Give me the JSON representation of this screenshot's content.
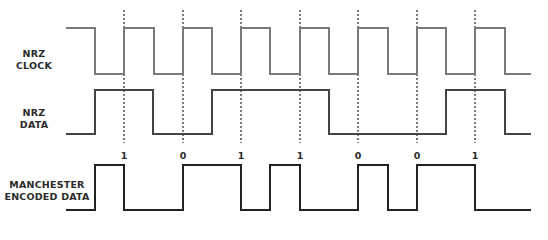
{
  "diagram": {
    "signals": [
      {
        "id": "nrz-clock",
        "label_lines": [
          "NRZ",
          "CLOCK"
        ],
        "color": "#7a7a7a",
        "y_high": 28,
        "y_low": 74,
        "points": [
          [
            66,
            28
          ],
          [
            95,
            28
          ],
          [
            95,
            74
          ],
          [
            124,
            74
          ],
          [
            124,
            28
          ],
          [
            154,
            28
          ],
          [
            154,
            74
          ],
          [
            183,
            74
          ],
          [
            183,
            28
          ],
          [
            212,
            28
          ],
          [
            212,
            74
          ],
          [
            241,
            74
          ],
          [
            241,
            28
          ],
          [
            270,
            28
          ],
          [
            270,
            74
          ],
          [
            300,
            74
          ],
          [
            300,
            28
          ],
          [
            329,
            28
          ],
          [
            329,
            74
          ],
          [
            358,
            74
          ],
          [
            358,
            28
          ],
          [
            388,
            28
          ],
          [
            388,
            74
          ],
          [
            417,
            74
          ],
          [
            417,
            28
          ],
          [
            446,
            28
          ],
          [
            446,
            74
          ],
          [
            475,
            74
          ],
          [
            475,
            28
          ],
          [
            505,
            28
          ],
          [
            505,
            74
          ],
          [
            531,
            74
          ]
        ]
      },
      {
        "id": "nrz-data",
        "label_lines": [
          "NRZ",
          "DATA"
        ],
        "color": "#444444",
        "y_high": 90,
        "y_low": 134,
        "points": [
          [
            66,
            134
          ],
          [
            95,
            134
          ],
          [
            95,
            90
          ],
          [
            153,
            90
          ],
          [
            153,
            134
          ],
          [
            212,
            134
          ],
          [
            212,
            90
          ],
          [
            329,
            90
          ],
          [
            329,
            134
          ],
          [
            446,
            134
          ],
          [
            446,
            90
          ],
          [
            505,
            90
          ],
          [
            505,
            134
          ],
          [
            531,
            134
          ]
        ]
      },
      {
        "id": "manchester",
        "label_lines": [
          "MANCHESTER",
          "ENCODED DATA"
        ],
        "color": "#222222",
        "y_high": 165,
        "y_low": 210,
        "points": [
          [
            66,
            210
          ],
          [
            95,
            210
          ],
          [
            95,
            165
          ],
          [
            124,
            165
          ],
          [
            124,
            210
          ],
          [
            183,
            210
          ],
          [
            183,
            165
          ],
          [
            241,
            165
          ],
          [
            241,
            210
          ],
          [
            270,
            210
          ],
          [
            270,
            165
          ],
          [
            300,
            165
          ],
          [
            300,
            210
          ],
          [
            358,
            210
          ],
          [
            358,
            165
          ],
          [
            388,
            165
          ],
          [
            388,
            210
          ],
          [
            417,
            210
          ],
          [
            417,
            165
          ],
          [
            475,
            165
          ],
          [
            475,
            210
          ],
          [
            531,
            210
          ]
        ]
      }
    ],
    "clock_edges_x": [
      124,
      183,
      241,
      300,
      358,
      417,
      475
    ],
    "dashed_line_color": "#333333",
    "dashed_top": 10,
    "dashed_bottom": 143,
    "bits": [
      {
        "x": 124,
        "value": "1"
      },
      {
        "x": 183,
        "value": "0"
      },
      {
        "x": 241,
        "value": "1"
      },
      {
        "x": 300,
        "value": "1"
      },
      {
        "x": 358,
        "value": "0"
      },
      {
        "x": 417,
        "value": "0"
      },
      {
        "x": 475,
        "value": "1"
      }
    ]
  },
  "labels": {
    "nrz_clock_1": "NRZ",
    "nrz_clock_2": "CLOCK",
    "nrz_data_1": "NRZ",
    "nrz_data_2": "DATA",
    "manchester_1": "MANCHESTER",
    "manchester_2": "ENCODED DATA"
  }
}
